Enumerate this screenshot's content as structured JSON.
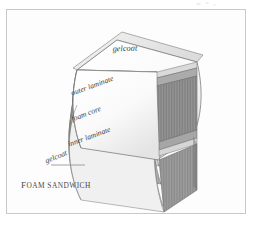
{
  "figure": {
    "caption": "FOAM SANDWICH",
    "caption_lead": "F",
    "caption_rest": "OAM SANDWICH",
    "background_color": "#ffffff",
    "frame_border_color": "#c9c9c9",
    "panel_color": "#fdfdfd"
  },
  "labels": [
    {
      "id": "gelcoat-top",
      "text": "gelcoat",
      "x": 118,
      "y": 41,
      "rotate": -2,
      "has_leader": false
    },
    {
      "id": "outer-laminate",
      "text": "outer laminate",
      "x": 86,
      "y": 77,
      "rotate": -20,
      "has_leader": false
    },
    {
      "id": "foam-core",
      "text": "foam core",
      "x": 80,
      "y": 105,
      "rotate": -21,
      "has_leader": false
    },
    {
      "id": "inner-laminate",
      "text": "inner laminate",
      "x": 83,
      "y": 128,
      "rotate": -20,
      "has_leader": false
    },
    {
      "id": "gelcoat-bottom",
      "text": "gelcoat",
      "x": 58,
      "y": 148,
      "rotate": -22,
      "has_leader": true
    }
  ],
  "layers": [
    {
      "name": "gelcoat",
      "role": "outer surface coat",
      "color": "#f2f2f2"
    },
    {
      "name": "outer laminate",
      "role": "fibre reinforced skin",
      "color": "#cdcdcd"
    },
    {
      "name": "foam core",
      "role": "core",
      "color": "#9a9a9a"
    },
    {
      "name": "inner laminate",
      "role": "fibre reinforced skin",
      "color": "#cdcdcd"
    },
    {
      "name": "gelcoat",
      "role": "inner surface coat",
      "color": "#f2f2f2"
    }
  ],
  "colors": {
    "top_face_light": "#fcfcfc",
    "top_face_shade": "#e6e6e6",
    "front_gelcoat": "#efefef",
    "front_laminate": "#c6c6c6",
    "front_core": "#9c9c9c",
    "side_gelcoat": "#d8d8d8",
    "side_laminate": "#a8a8a8",
    "side_core": "#7e7e7e",
    "outline": "#6f6f6f",
    "label_text": "#3d3d3d",
    "leader_line": "#8a8a8a"
  }
}
